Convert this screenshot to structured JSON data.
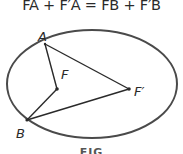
{
  "equation": "FA + F′A = FB + F′B",
  "figure": {
    "ellipse": {
      "cx": 92,
      "cy": 84,
      "rx": 85,
      "ry": 54,
      "stroke": "#4a4a4a"
    },
    "points": {
      "A": {
        "x": 45,
        "y": 44,
        "label": "A"
      },
      "B": {
        "x": 27,
        "y": 120,
        "label": "B"
      },
      "F": {
        "x": 57,
        "y": 89,
        "label": "F"
      },
      "F_prime": {
        "x": 129,
        "y": 89,
        "label": "F′"
      }
    },
    "segments": [
      "A-F",
      "A-F′",
      "B-F",
      "B-F′"
    ],
    "line_color": "#2a2a2a"
  },
  "caption": "FIG"
}
